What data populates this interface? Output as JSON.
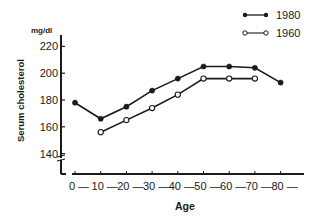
{
  "chart_data": {
    "type": "line",
    "title": "",
    "xlabel": "Age",
    "ylabel": "Serum cholesterol",
    "y_unit": "mg/dl",
    "x": [
      0,
      10,
      20,
      30,
      40,
      50,
      60,
      70,
      80
    ],
    "x_tick_labels": [
      "0",
      "10",
      "20",
      "30",
      "40",
      "50",
      "60",
      "70",
      "80"
    ],
    "y_ticks": [
      140,
      160,
      180,
      200,
      220
    ],
    "y_tick_labels": [
      "140",
      "160",
      "180",
      "200",
      "220"
    ],
    "ylim": [
      130,
      225
    ],
    "y_axis_break": true,
    "grid": false,
    "legend_position": "top-right",
    "series": [
      {
        "name": "1980",
        "marker": "filled-circle",
        "color": "#1a1a1a",
        "x": [
          0,
          10,
          20,
          30,
          40,
          50,
          60,
          70,
          80
        ],
        "values": [
          178,
          166,
          175,
          187,
          196,
          205,
          205,
          204,
          193
        ]
      },
      {
        "name": "1960",
        "marker": "open-circle",
        "color": "#1a1a1a",
        "x": [
          10,
          20,
          30,
          40,
          50,
          60,
          70
        ],
        "values": [
          156,
          165,
          174,
          184,
          196,
          196,
          196
        ]
      }
    ]
  },
  "legend": {
    "items": [
      {
        "label": "1980",
        "marker": "filled-circle"
      },
      {
        "label": "1960",
        "marker": "open-circle"
      }
    ]
  },
  "axes": {
    "y_unit": "mg/dl",
    "y_title": "Serum cholesterol",
    "x_title": "Age"
  }
}
